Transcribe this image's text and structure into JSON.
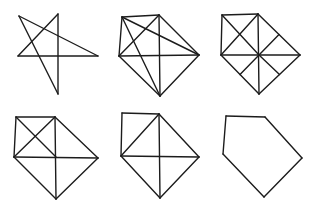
{
  "canvas": {
    "width": 320,
    "height": 213,
    "background": "#ffffff",
    "stroke_color": "#1c1c1c",
    "stroke_width": 1.4
  },
  "figures": [
    {
      "name": "pentagram-star",
      "grid_position": "row-1-col-1",
      "segments": [
        [
          19,
          16,
          98,
          56
        ],
        [
          19,
          16,
          58,
          94
        ],
        [
          58,
          14,
          18,
          56
        ],
        [
          58,
          14,
          58,
          94
        ],
        [
          18,
          56,
          98,
          56
        ]
      ]
    },
    {
      "name": "pentagon-with-all-diagonals",
      "grid_position": "row-1-col-2",
      "segments": [
        [
          122,
          17,
          159,
          15
        ],
        [
          159,
          15,
          199,
          55
        ],
        [
          199,
          55,
          160,
          96
        ],
        [
          160,
          96,
          119,
          56
        ],
        [
          119,
          56,
          122,
          17
        ],
        [
          122,
          17,
          199,
          55
        ],
        [
          122,
          17,
          160,
          96
        ],
        [
          159,
          15,
          119,
          56
        ],
        [
          159,
          15,
          160,
          96
        ],
        [
          119,
          56,
          199,
          55
        ]
      ]
    },
    {
      "name": "square-diamond-eight-rays",
      "grid_position": "row-1-col-3",
      "segments": [
        [
          222,
          15,
          258,
          14
        ],
        [
          222,
          15,
          221,
          55
        ],
        [
          258,
          14,
          221,
          55
        ],
        [
          258,
          14,
          300,
          55
        ],
        [
          300,
          55,
          259,
          94
        ],
        [
          259,
          94,
          221,
          55
        ],
        [
          258,
          14,
          259,
          94
        ],
        [
          221,
          55,
          300,
          55
        ],
        [
          222,
          15,
          259,
          55
        ],
        [
          259,
          55,
          279.5,
          74.5
        ],
        [
          259,
          55,
          279,
          34.5
        ],
        [
          259,
          55,
          240,
          74.5
        ]
      ]
    },
    {
      "name": "square-x-diamond-cross",
      "grid_position": "row-2-col-1",
      "segments": [
        [
          16,
          117,
          55,
          117
        ],
        [
          16,
          117,
          14,
          157
        ],
        [
          55,
          117,
          14,
          157
        ],
        [
          16,
          117,
          56,
          157
        ],
        [
          55,
          117,
          98,
          158
        ],
        [
          98,
          158,
          56,
          199
        ],
        [
          56,
          199,
          14,
          157
        ],
        [
          55,
          117,
          56,
          199
        ],
        [
          14,
          157,
          98,
          158
        ]
      ]
    },
    {
      "name": "square-single-diagonal-diamond-cross",
      "grid_position": "row-2-col-2",
      "segments": [
        [
          122,
          113,
          159,
          114
        ],
        [
          122,
          113,
          121,
          156
        ],
        [
          159,
          114,
          121,
          156
        ],
        [
          159,
          114,
          199,
          157
        ],
        [
          199,
          157,
          160,
          198
        ],
        [
          160,
          198,
          121,
          156
        ],
        [
          159,
          114,
          160,
          198
        ],
        [
          121,
          156,
          199,
          157
        ]
      ]
    },
    {
      "name": "pentagon-outline",
      "grid_position": "row-2-col-3",
      "segments": [
        [
          226,
          116,
          265,
          117
        ],
        [
          265,
          117,
          302,
          158
        ],
        [
          302,
          158,
          264,
          197
        ],
        [
          264,
          197,
          223,
          154
        ],
        [
          223,
          154,
          226,
          116
        ]
      ]
    }
  ]
}
